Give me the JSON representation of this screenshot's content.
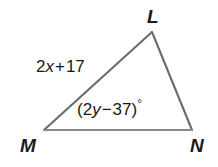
{
  "figure": {
    "type": "triangle-diagram",
    "shape_name": "triangle-LMN",
    "stroke_color": "#6b6b6b",
    "text_color": "#1b1b1b",
    "background_color": "#ffffff",
    "vertices": [
      {
        "name": "L",
        "label": "L",
        "x": 152,
        "y": 32
      },
      {
        "name": "M",
        "label": "M",
        "x": 44,
        "y": 130
      },
      {
        "name": "N",
        "label": "N",
        "x": 192,
        "y": 130
      }
    ],
    "sides": [
      {
        "name": "ML",
        "label": "2x + 17",
        "label_parts": {
          "coefficient": "2",
          "variable": "x",
          "operator": "+",
          "constant": "17"
        }
      },
      {
        "name": "LN",
        "label": ""
      },
      {
        "name": "MN",
        "label": ""
      }
    ],
    "angles": [
      {
        "at_vertex": "M",
        "label": "(2y − 37)°",
        "label_parts": {
          "open": "(",
          "coefficient": "2",
          "variable": "y",
          "operator": "−",
          "constant": "37",
          "close": ")",
          "degree": "°"
        }
      }
    ]
  }
}
